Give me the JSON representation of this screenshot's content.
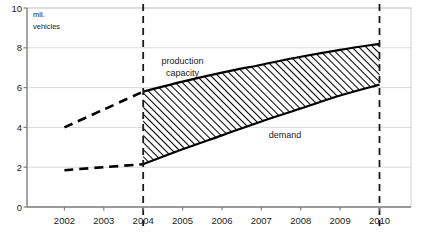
{
  "chart_data": {
    "type": "area",
    "title": "",
    "xlabel": "",
    "ylabel": "mil. vehicles",
    "unit_label_line1": "mil.",
    "unit_label_line2": "vehicles",
    "x": [
      2002,
      2003,
      2004,
      2005,
      2006,
      2007,
      2008,
      2009,
      2010
    ],
    "categories": [
      "2002",
      "2003",
      "2004",
      "2005",
      "2006",
      "2007",
      "2008",
      "2009",
      "2010"
    ],
    "xlim": [
      2001.05,
      2010.8
    ],
    "ylim": [
      0,
      10
    ],
    "yticks": [
      0,
      2,
      4,
      6,
      8,
      10
    ],
    "ytick_labels": [
      "0",
      "2",
      "4",
      "6",
      "8",
      "10"
    ],
    "grid": true,
    "legend": "none",
    "series": [
      {
        "name": "production capacity",
        "label": "production capacity",
        "label_line1": "production",
        "label_line2": "capacity",
        "color": "#000000",
        "values": [
          4.0,
          4.9,
          5.8,
          6.3,
          6.75,
          7.15,
          7.55,
          7.9,
          8.2
        ],
        "historical_style": "dashed",
        "forecast_style": "solid",
        "historical_x": [
          2002,
          2003,
          2004
        ],
        "historical_values": [
          4.0,
          4.9,
          5.8
        ],
        "forecast_x": [
          2004,
          2005,
          2006,
          2007,
          2008,
          2009,
          2010
        ],
        "forecast_values": [
          5.8,
          6.3,
          6.75,
          7.15,
          7.55,
          7.9,
          8.2
        ]
      },
      {
        "name": "demand",
        "label": "demand",
        "color": "#000000",
        "values": [
          1.85,
          2.0,
          2.15,
          2.9,
          3.6,
          4.3,
          4.95,
          5.6,
          6.15
        ],
        "historical_style": "dashed",
        "forecast_style": "solid",
        "historical_x": [
          2002,
          2003,
          2004
        ],
        "historical_values": [
          1.85,
          2.0,
          2.15
        ],
        "forecast_x": [
          2004,
          2005,
          2006,
          2007,
          2008,
          2009,
          2010
        ],
        "forecast_values": [
          2.15,
          2.9,
          3.6,
          4.3,
          4.95,
          5.6,
          6.15
        ]
      }
    ],
    "shaded_band": {
      "name": "overcapacity-gap",
      "fill": "hatch-diagonal",
      "from_series": "demand",
      "to_series": "production capacity",
      "x_start": 2004,
      "x_end": 2010
    },
    "markers": [
      {
        "name": "forecast-start",
        "x": 2004,
        "style": "dashed-vertical"
      },
      {
        "name": "forecast-end",
        "x": 2010,
        "style": "dashed-vertical"
      }
    ],
    "annotations": [
      {
        "name": "production-capacity-label",
        "text": "production capacity",
        "x": 2005.0,
        "y": 7.2
      },
      {
        "name": "demand-label",
        "text": "demand",
        "x": 2007.6,
        "y": 3.45
      }
    ],
    "colors": {
      "axis": "#808080",
      "grid": "#d9d9d9",
      "line": "#000000",
      "marker_line": "#1a1a1a",
      "text": "#1a1a1a",
      "background": "#ffffff"
    }
  }
}
